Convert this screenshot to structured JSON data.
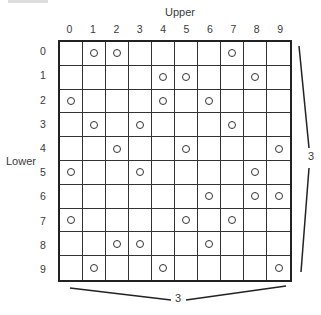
{
  "diagram": {
    "column_axis_title": "Upper",
    "row_axis_title": "Lower",
    "column_labels": [
      "0",
      "1",
      "2",
      "3",
      "4",
      "5",
      "6",
      "7",
      "8",
      "9"
    ],
    "row_labels": [
      "0",
      "1",
      "2",
      "3",
      "4",
      "5",
      "6",
      "7",
      "8",
      "9"
    ],
    "rows": 10,
    "cols": 10,
    "marked_cells": [
      {
        "row": 0,
        "cols": [
          1,
          2,
          7
        ]
      },
      {
        "row": 1,
        "cols": [
          4,
          5,
          8
        ]
      },
      {
        "row": 2,
        "cols": [
          0,
          4,
          6
        ]
      },
      {
        "row": 3,
        "cols": [
          1,
          3,
          7
        ]
      },
      {
        "row": 4,
        "cols": [
          2,
          5,
          9
        ]
      },
      {
        "row": 5,
        "cols": [
          0,
          3,
          8
        ]
      },
      {
        "row": 6,
        "cols": [
          6,
          8,
          9
        ]
      },
      {
        "row": 7,
        "cols": [
          0,
          5,
          7
        ]
      },
      {
        "row": 8,
        "cols": [
          2,
          3,
          6
        ]
      },
      {
        "row": 9,
        "cols": [
          1,
          4,
          9
        ]
      }
    ],
    "marker_symbol": "circle",
    "bottom_bracket_label": "3",
    "right_bracket_label": "3"
  },
  "colors": {
    "grid_line": "#222222",
    "text": "#3a3a3a",
    "background": "#ffffff"
  }
}
